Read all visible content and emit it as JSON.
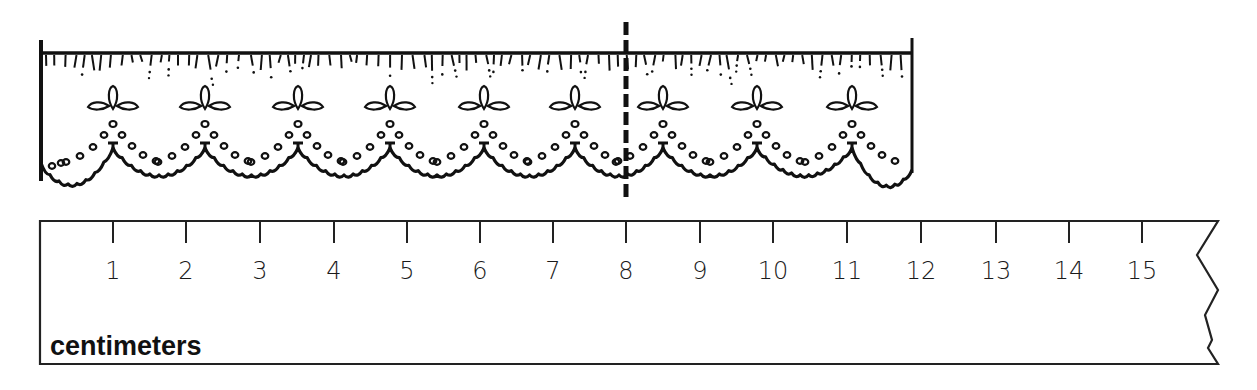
{
  "figure": {
    "title": "",
    "colors": {
      "ink": "#111111",
      "background": "#ffffff"
    }
  },
  "lace": {
    "left_x": 41,
    "right_x": 912,
    "top_y": 53,
    "scallop_peaks_x": [
      113,
      205,
      298,
      390,
      484,
      575,
      663,
      757,
      852
    ],
    "dashed_marker_x": 626
  },
  "ruler": {
    "unit_label": "centimeters",
    "ticks": [
      {
        "label": "1",
        "x": 113
      },
      {
        "label": "2",
        "x": 186
      },
      {
        "label": "3",
        "x": 260
      },
      {
        "label": "4",
        "x": 334
      },
      {
        "label": "5",
        "x": 407
      },
      {
        "label": "6",
        "x": 480
      },
      {
        "label": "7",
        "x": 553
      },
      {
        "label": "8",
        "x": 626
      },
      {
        "label": "9",
        "x": 700
      },
      {
        "label": "10",
        "x": 773
      },
      {
        "label": "11",
        "x": 847
      },
      {
        "label": "12",
        "x": 921
      },
      {
        "label": "13",
        "x": 996
      },
      {
        "label": "14",
        "x": 1069
      },
      {
        "label": "15",
        "x": 1142
      }
    ]
  }
}
